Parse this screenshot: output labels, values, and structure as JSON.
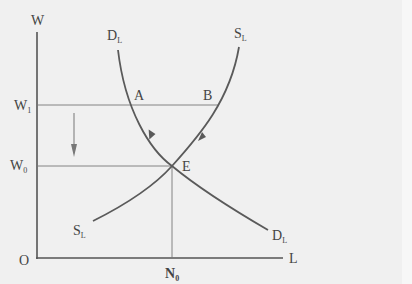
{
  "diagram": {
    "axes": {
      "y_label": "W",
      "x_label": "L",
      "origin_label": "O"
    },
    "wage_levels": [
      {
        "label": "W",
        "subscript": "1"
      },
      {
        "label": "W",
        "subscript": "0"
      }
    ],
    "quantity_levels": [
      {
        "label": "N",
        "subscript": "0"
      }
    ],
    "curves": {
      "demand": {
        "label": "D",
        "subscript": "L"
      },
      "supply": {
        "label": "S",
        "subscript": "L"
      }
    },
    "points": {
      "a": "A",
      "b": "B",
      "e": "E"
    },
    "annotation": "downward arrow indicating wage falls from W1 to W0"
  }
}
